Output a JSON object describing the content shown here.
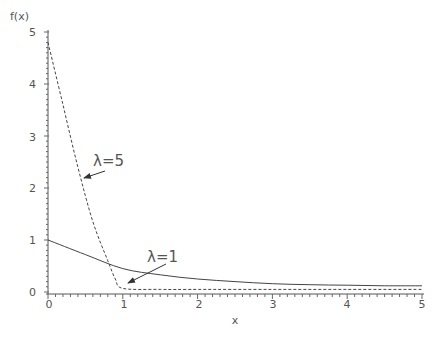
{
  "chart_data": {
    "type": "line",
    "title": "",
    "xlabel": "x",
    "ylabel": "f(x)",
    "xlim": [
      0,
      5
    ],
    "ylim": [
      0,
      5
    ],
    "x_ticks": [
      "0",
      "1",
      "2",
      "3",
      "4",
      "5"
    ],
    "y_ticks": [
      "0",
      "1",
      "2",
      "3",
      "4",
      "5"
    ],
    "grid": false,
    "legend": null,
    "series": [
      {
        "name": "λ=1",
        "style": "solid",
        "x": [
          0,
          0.5,
          1,
          1.5,
          2,
          2.5,
          3,
          3.5,
          4,
          4.5,
          5
        ],
        "y": [
          1.0,
          0.72,
          0.45,
          0.33,
          0.25,
          0.2,
          0.16,
          0.14,
          0.13,
          0.12,
          0.12
        ]
      },
      {
        "name": "λ=5",
        "style": "dashed",
        "x": [
          0,
          0.2,
          0.4,
          0.6,
          0.8,
          0.9,
          1.0,
          1.5,
          2,
          3,
          4,
          5
        ],
        "y": [
          4.8,
          3.6,
          2.4,
          1.35,
          0.6,
          0.25,
          0.07,
          0.05,
          0.05,
          0.05,
          0.05,
          0.05
        ]
      }
    ],
    "annotations": [
      {
        "text": "λ=5",
        "points_to": "dashed curve near x=0.45, y=2.2"
      },
      {
        "text": "λ=1",
        "points_to": "dashed curve near x=1.05, y=0.2"
      }
    ]
  },
  "labels": {
    "ylabel": "f(x)",
    "xlabel": "x",
    "annot_l5": "λ=5",
    "annot_l1": "λ=1",
    "xt0": "0",
    "xt1": "1",
    "xt2": "2",
    "xt3": "3",
    "xt4": "4",
    "xt5": "5",
    "yt0": "0",
    "yt1": "1",
    "yt2": "2",
    "yt3": "3",
    "yt4": "4",
    "yt5": "5"
  }
}
